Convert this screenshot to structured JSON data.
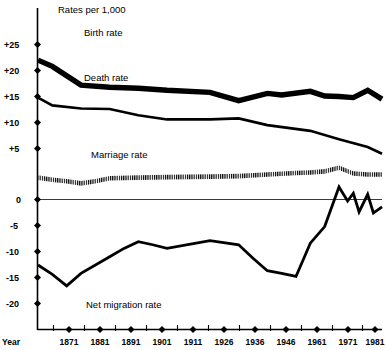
{
  "chart_data": {
    "type": "line",
    "title": "Rates per 1,000",
    "xlabel": "Year",
    "ylabel": "",
    "grid": false,
    "legend_position": "inline-annotations",
    "xlim": [
      1866,
      1986
    ],
    "ylim": [
      -20,
      27
    ],
    "y_ticks": [
      "+25",
      "+20",
      "+15",
      "+10",
      "+5",
      "0",
      "-5",
      "-10",
      "-15",
      "-20"
    ],
    "y_tick_values": [
      25,
      20,
      15,
      10,
      5,
      0,
      -5,
      -10,
      -15,
      -20
    ],
    "categories": [
      1871,
      1881,
      1891,
      1901,
      1911,
      1926,
      1936,
      1946,
      1961,
      1971,
      1981
    ],
    "x_tick_labels": [
      "1871",
      "1881",
      "1891",
      "1901",
      "1911",
      "1926",
      "1936",
      "1946",
      "1961",
      "1971",
      "1981"
    ],
    "series": [
      {
        "name": "Birth rate",
        "style": "thick-solid",
        "x": [
          1866,
          1871,
          1881,
          1891,
          1901,
          1911,
          1926,
          1936,
          1946,
          1951,
          1961,
          1966,
          1971,
          1976,
          1981,
          1986
        ],
        "values": [
          26.8,
          25.6,
          22.0,
          21.6,
          21.4,
          21.0,
          20.6,
          19.0,
          20.4,
          20.1,
          20.8,
          19.9,
          19.8,
          19.6,
          21.0,
          19.3
        ]
      },
      {
        "name": "Death rate",
        "style": "medium-solid",
        "x": [
          1866,
          1871,
          1881,
          1891,
          1901,
          1911,
          1926,
          1936,
          1946,
          1961,
          1971,
          1981,
          1986
        ],
        "values": [
          19.6,
          18.1,
          17.5,
          17.4,
          16.2,
          15.4,
          15.4,
          15.6,
          14.3,
          13.2,
          11.6,
          10.1,
          8.8
        ]
      },
      {
        "name": "Marriage rate",
        "style": "hatched-band",
        "x": [
          1866,
          1871,
          1876,
          1881,
          1886,
          1891,
          1901,
          1911,
          1926,
          1936,
          1946,
          1956,
          1961,
          1966,
          1971,
          1976,
          1981,
          1986
        ],
        "values": [
          4.2,
          3.8,
          3.5,
          3.1,
          3.5,
          4.1,
          4.2,
          4.3,
          4.4,
          4.5,
          4.8,
          5.1,
          5.2,
          5.4,
          6.1,
          5.0,
          4.8,
          4.8
        ]
      },
      {
        "name": "Net migration rate",
        "style": "medium-solid",
        "x": [
          1866,
          1871,
          1876,
          1881,
          1891,
          1896,
          1901,
          1906,
          1911,
          1926,
          1936,
          1941,
          1946,
          1951,
          1956,
          1961,
          1966,
          1971,
          1974,
          1976,
          1978,
          1981,
          1983,
          1986
        ],
        "values": [
          -12.6,
          -14.4,
          -16.6,
          -14.2,
          -11.0,
          -9.4,
          -8.1,
          -8.7,
          -9.4,
          -7.9,
          -8.7,
          -11.3,
          -13.7,
          -14.2,
          -14.8,
          -8.4,
          -5.2,
          2.4,
          -0.3,
          1.2,
          -2.4,
          1.0,
          -2.6,
          -1.4
        ]
      }
    ],
    "annotations": [
      {
        "text": "Rates per 1,000",
        "x": 1873,
        "y": 27.2
      },
      {
        "text": "Birth rate",
        "x": 1881,
        "y": 24.3
      },
      {
        "text": "Death rate",
        "x": 1881,
        "y": 19.6
      },
      {
        "text": "Marriage rate",
        "x": 1890,
        "y": 7.3
      },
      {
        "text": "Net migration rate",
        "x": 1888,
        "y": -16.6
      }
    ]
  },
  "figure": {
    "title": "Rates per 1,000",
    "x_axis_caption": "Year",
    "series_labels": {
      "birth": "Birth rate",
      "death": "Death rate",
      "marriage": "Marriage rate",
      "migration": "Net migration rate"
    },
    "y_labels": {
      "p25": "+25",
      "p20": "+20",
      "p15": "+15",
      "p10": "+10",
      "p5": "+5",
      "zero": "0",
      "m5": "-5",
      "m10": "-10",
      "m15": "-15",
      "m20": "-20"
    },
    "x_labels": {
      "t1871": "1871",
      "t1881": "1881",
      "t1891": "1891",
      "t1901": "1901",
      "t1911": "1911",
      "t1926": "1926",
      "t1936": "1936",
      "t1946": "1946",
      "t1961": "1961",
      "t1971": "1971",
      "t1981": "1981"
    },
    "colors": {
      "ink": "#000000",
      "background": "#ffffff",
      "zero_rule": "#3a3a3a"
    }
  }
}
